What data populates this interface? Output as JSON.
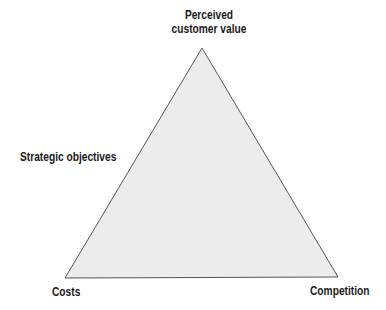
{
  "diagram": {
    "type": "triangle",
    "vertices": {
      "top": "Perceived customer value",
      "bottom_left": "Costs",
      "bottom_right": "Competition"
    },
    "apex_label_lines": [
      "Perceived",
      "customer value"
    ],
    "side_label": "Strategic objectives",
    "bottom_left_label": "Costs",
    "bottom_right_label": "Competition",
    "fill_color": "#ececec",
    "stroke_color": "#555555"
  }
}
